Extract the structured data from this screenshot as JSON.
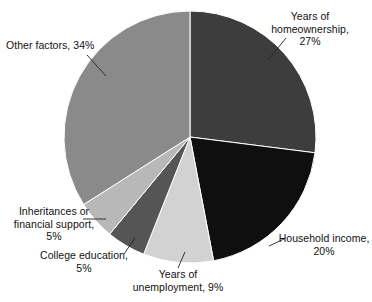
{
  "chart_data": {
    "type": "pie",
    "title": "",
    "subtitle": "",
    "xlabel": "",
    "ylabel": "",
    "legend_position": "none",
    "grid": false,
    "value_unit": "percent",
    "start_angle_deg": 0,
    "direction": "clockwise",
    "categories": [
      "Years of homeownership",
      "Household income",
      "Years of unemployment",
      "College education",
      "Inheritances or financial support",
      "Other factors"
    ],
    "values": [
      27,
      20,
      9,
      5,
      5,
      34
    ],
    "colors": [
      "#3d3d3d",
      "#0f0f0f",
      "#d2d2d2",
      "#555555",
      "#b8b8b8",
      "#8a8a8a"
    ],
    "slices": [
      {
        "name": "Years of homeownership",
        "value": 27,
        "value_text": "27%",
        "color": "#3d3d3d",
        "label_line1": "Years of",
        "label_line2": "homeownership,",
        "label_line3": "27%"
      },
      {
        "name": "Household income",
        "value": 20,
        "value_text": "20%",
        "color": "#0f0f0f",
        "label_line1": "Household income,",
        "label_line2": "20%",
        "label_line3": ""
      },
      {
        "name": "Years of unemployment",
        "value": 9,
        "value_text": "9%",
        "color": "#d2d2d2",
        "label_line1": "Years of",
        "label_line2": "unemployment, 9%",
        "label_line3": ""
      },
      {
        "name": "College education",
        "value": 5,
        "value_text": "5%",
        "color": "#555555",
        "label_line1": "College education,",
        "label_line2": "5%",
        "label_line3": ""
      },
      {
        "name": "Inheritances or financial support",
        "value": 5,
        "value_text": "5%",
        "color": "#b8b8b8",
        "label_line1": "Inheritances or",
        "label_line2": "financial support,",
        "label_line3": "5%"
      },
      {
        "name": "Other factors",
        "value": 34,
        "value_text": "34%",
        "color": "#8a8a8a",
        "label_line1": "Other factors, 34%",
        "label_line2": "",
        "label_line3": ""
      }
    ]
  },
  "style": {
    "background": "#ffffff",
    "text_color": "#111111",
    "leader_line_color": "#222222",
    "slice_border_color": "#ffffff"
  },
  "geometry": {
    "center_x": 190,
    "center_y": 137,
    "radius": 126
  }
}
